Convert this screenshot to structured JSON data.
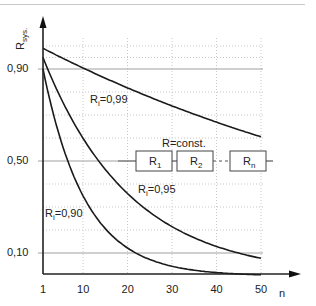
{
  "chart_data": {
    "type": "line",
    "title": "",
    "xlabel": "n",
    "ylabel": "R_sys.",
    "xlim": [
      1,
      50
    ],
    "ylim": [
      0,
      1.0
    ],
    "x_ticks": [
      "1",
      "10",
      "20",
      "30",
      "40",
      "50"
    ],
    "y_ticks": [
      "0,10",
      "0,50",
      "0,90"
    ],
    "grid": true,
    "formula": "R_sys = R_i^n",
    "series": [
      {
        "name": "R_i=0,99",
        "label_main": "R",
        "label_sub": "i",
        "label_val": "=0,99",
        "ri": 0.99,
        "x": [
          1,
          10,
          20,
          30,
          40,
          50
        ],
        "values": [
          0.99,
          0.904,
          0.818,
          0.74,
          0.669,
          0.605
        ]
      },
      {
        "name": "R_i=0,95",
        "label_main": "R",
        "label_sub": "i",
        "label_val": "=0,95",
        "ri": 0.95,
        "x": [
          1,
          10,
          20,
          30,
          40,
          50
        ],
        "values": [
          0.95,
          0.599,
          0.358,
          0.215,
          0.129,
          0.077
        ]
      },
      {
        "name": "R_i=0,90",
        "label_main": "R",
        "label_sub": "i",
        "label_val": "=0,90",
        "ri": 0.9,
        "x": [
          1,
          10,
          20,
          30,
          40,
          50
        ],
        "values": [
          0.9,
          0.349,
          0.122,
          0.042,
          0.015,
          0.005
        ]
      }
    ],
    "annotations": {
      "diagram_title": "R=const.",
      "blocks": [
        {
          "main": "R",
          "sub": "1"
        },
        {
          "main": "R",
          "sub": "2"
        },
        {
          "main": "R",
          "sub": "n"
        }
      ]
    },
    "colors": {
      "line": "#1a1a1a",
      "grid_solid": "#a0a0a0",
      "grid_dotted": "#c8c8c8"
    }
  }
}
